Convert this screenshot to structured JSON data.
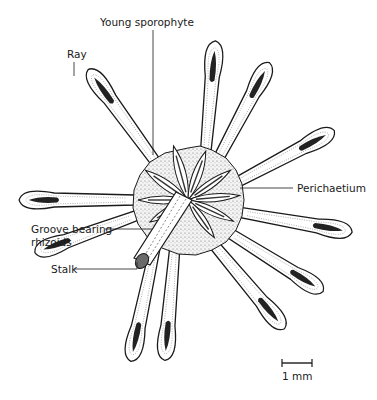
{
  "figure": {
    "type": "botanical-illustration",
    "labels": {
      "young_sporophyte": "Young sporophyte",
      "ray": "Ray",
      "perichaetium": "Perichaetium",
      "groove_bearing_rhizoids_line1": "Groove bearing",
      "groove_bearing_rhizoids_line2": "rhizoids",
      "stalk": "Stalk"
    },
    "scale_bar": {
      "label": "1 mm"
    },
    "colors": {
      "ink": "#1a1a1a",
      "background": "#ffffff",
      "stipple": "#8c8c8c"
    }
  }
}
